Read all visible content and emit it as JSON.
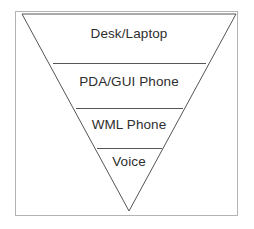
{
  "figure": {
    "type": "inverted-pyramid-diagram",
    "background_color": "#ffffff",
    "frame": {
      "stroke_color": "#b3b3b3",
      "stroke_width": 1,
      "fill": "none",
      "x": 15,
      "y": 11,
      "width": 223,
      "height": 205
    },
    "pyramid": {
      "stroke_color": "#555555",
      "stroke_width": 1,
      "fill": "none",
      "orientation": "inverted",
      "apex": {
        "x": 129,
        "y": 211
      },
      "top_left": {
        "x": 22,
        "y": 14
      },
      "top_right": {
        "x": 236,
        "y": 14
      }
    },
    "divider_color": "#555555",
    "label_color": "#2e2e2e"
  },
  "tiers": [
    {
      "label": "Desk/Laptop",
      "index": 0,
      "divider_y": 63,
      "divider_x1": 53,
      "divider_x2": 206,
      "label_x": 129,
      "label_y": 34
    },
    {
      "label": "PDA/GUI Phone",
      "index": 1,
      "divider_y": 108,
      "divider_x1": 76,
      "divider_x2": 183,
      "label_x": 129,
      "label_y": 82
    },
    {
      "label": "WML Phone",
      "index": 2,
      "divider_y": 148,
      "divider_x1": 97,
      "divider_x2": 162,
      "label_x": 129,
      "label_y": 125
    },
    {
      "label": "Voice",
      "index": 3,
      "divider_y": null,
      "divider_x1": null,
      "divider_x2": null,
      "label_x": 129,
      "label_y": 162
    }
  ]
}
